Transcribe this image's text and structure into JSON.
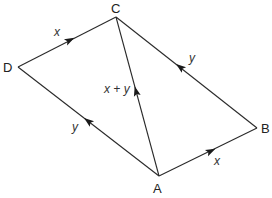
{
  "diagram": {
    "type": "vector-parallelogram",
    "vertices": {
      "A": {
        "label": "A",
        "x": 159,
        "y": 176
      },
      "B": {
        "label": "B",
        "x": 257,
        "y": 128
      },
      "C": {
        "label": "C",
        "x": 116,
        "y": 17
      },
      "D": {
        "label": "D",
        "x": 18,
        "y": 67
      }
    },
    "edges": [
      {
        "id": "DC",
        "from": "D",
        "to": "C",
        "label": "x"
      },
      {
        "id": "AD",
        "from": "A",
        "to": "D",
        "label": "y"
      },
      {
        "id": "BC",
        "from": "B",
        "to": "C",
        "label": "y"
      },
      {
        "id": "AB",
        "from": "A",
        "to": "B",
        "label": "x"
      },
      {
        "id": "AC",
        "from": "A",
        "to": "C",
        "label": "x + y"
      }
    ],
    "colors": {
      "line": "#2a2a2a",
      "text": "#222222",
      "background": "#ffffff"
    }
  }
}
